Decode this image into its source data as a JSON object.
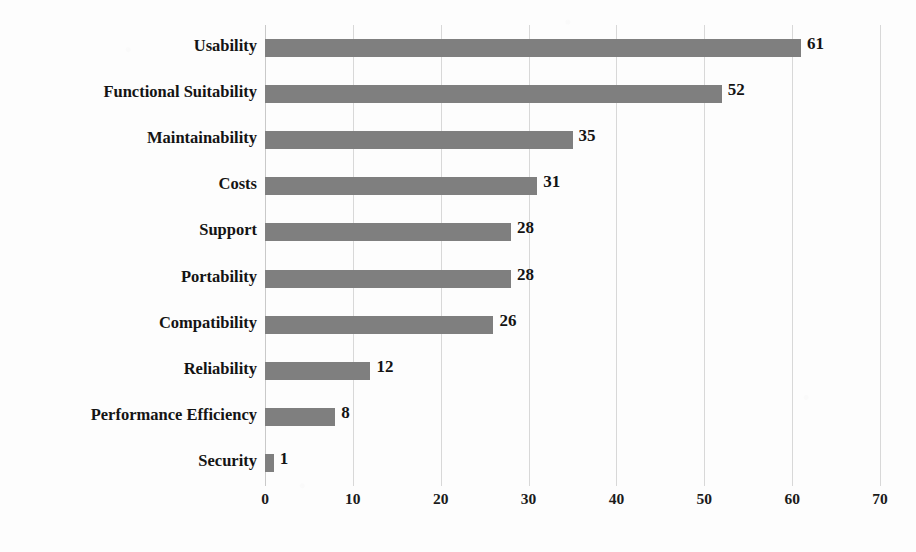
{
  "chart_data": {
    "type": "bar",
    "orientation": "horizontal",
    "title": "",
    "subtitle": "",
    "xlabel": "",
    "ylabel": "",
    "categories": [
      "Usability",
      "Functional Suitability",
      "Maintainability",
      "Costs",
      "Support",
      "Portability",
      "Compatibility",
      "Reliability",
      "Performance Efficiency",
      "Security"
    ],
    "values": [
      61,
      52,
      35,
      31,
      28,
      28,
      26,
      12,
      8,
      1
    ],
    "data_labels": [
      "61",
      "52",
      "35",
      "31",
      "28",
      "28",
      "26",
      "12",
      "8",
      "1"
    ],
    "xlim": [
      0,
      70
    ],
    "xticks": [
      0,
      10,
      20,
      30,
      40,
      50,
      60,
      70
    ],
    "xtick_labels": [
      "0",
      "10",
      "20",
      "30",
      "40",
      "50",
      "60",
      "70"
    ],
    "grid": "vertical",
    "legend": "none",
    "bar_color": "#7f7f7f",
    "background_color": "#fdfdfd",
    "gridline_color": "#d8d8d8",
    "text_color": "#141414"
  }
}
